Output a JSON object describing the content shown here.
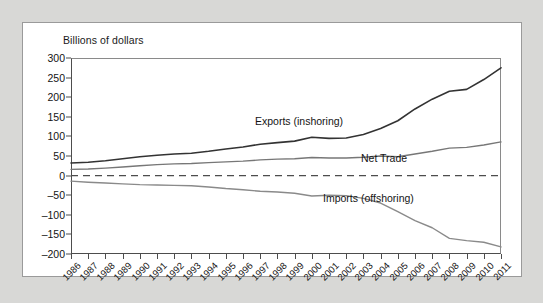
{
  "figure": {
    "axis_title": "Billions of dollars",
    "background_color": "#d8d8d6",
    "panel_color": "#ffffff"
  },
  "chart_data": {
    "type": "line",
    "title": "",
    "subtitle": "",
    "xlabel": "",
    "ylabel": "Billions of dollars",
    "ylim": [
      -200,
      300
    ],
    "yticks": [
      300,
      250,
      200,
      150,
      100,
      50,
      0,
      -50,
      -100,
      -150,
      -200
    ],
    "ytick_labels": [
      "300",
      "250",
      "200",
      "150",
      "100",
      "50",
      "0",
      "–50",
      "–100",
      "–150",
      "–200"
    ],
    "grid": false,
    "legend_position": "inline-annotations",
    "zero_line": {
      "value": 0,
      "style": "dashed",
      "color": "#4d4d4d"
    },
    "categories": [
      "1986",
      "1987",
      "1988",
      "1989",
      "1990",
      "1991",
      "1992",
      "1993",
      "1994",
      "1995",
      "1996",
      "1997",
      "1998",
      "1999",
      "2000",
      "2001",
      "2002",
      "2003",
      "2004",
      "2005",
      "2006",
      "2007",
      "2008",
      "2009",
      "2010",
      "2011"
    ],
    "series": [
      {
        "name": "Exports (inshoring)",
        "color": "#333333",
        "values": [
          32,
          34,
          38,
          43,
          48,
          52,
          55,
          57,
          62,
          68,
          73,
          80,
          84,
          88,
          98,
          95,
          96,
          105,
          120,
          140,
          170,
          195,
          215,
          220,
          245,
          275
        ]
      },
      {
        "name": "Net Trade",
        "color": "#777777",
        "values": [
          16,
          17,
          19,
          22,
          25,
          28,
          30,
          31,
          33,
          35,
          37,
          40,
          42,
          43,
          46,
          45,
          45,
          47,
          50,
          48,
          55,
          62,
          70,
          72,
          78,
          86
        ]
      },
      {
        "name": "Imports (offshoring)",
        "color": "#8a8a8a",
        "values": [
          -14,
          -17,
          -19,
          -21,
          -23,
          -24,
          -25,
          -26,
          -29,
          -33,
          -36,
          -40,
          -42,
          -45,
          -52,
          -50,
          -51,
          -58,
          -70,
          -92,
          -115,
          -133,
          -160,
          -166,
          -170,
          -182
        ]
      }
    ],
    "annotations": [
      {
        "text": "Exports (inshoring)",
        "series": "Exports (inshoring)"
      },
      {
        "text": "Net Trade",
        "series": "Net Trade"
      },
      {
        "text": "Imports (offshoring)",
        "series": "Imports (offshoring)"
      }
    ]
  }
}
